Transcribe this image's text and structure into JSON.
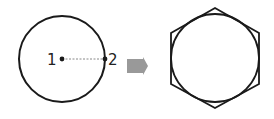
{
  "diagram": {
    "left_figure": {
      "shape": "circle",
      "center": {
        "x": 62,
        "y": 59
      },
      "radius": 43,
      "points": [
        {
          "label": "1",
          "x": 62,
          "y": 59
        },
        {
          "label": "2",
          "x": 105,
          "y": 59
        }
      ],
      "radius_line": "dashed"
    },
    "arrow": {
      "direction": "right",
      "color": "#999999"
    },
    "right_figure": {
      "shape": "hexagon circumscribing circle",
      "center": {
        "x": 215,
        "y": 58
      },
      "circle_radius": 43
    },
    "colors": {
      "stroke": "#1a1a1a",
      "dashed": "#888888",
      "arrow": "#999999"
    }
  }
}
